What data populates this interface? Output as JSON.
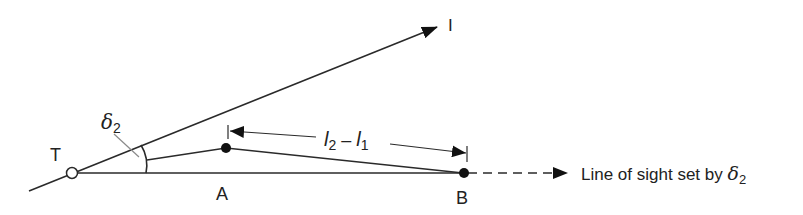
{
  "diagram": {
    "labels": {
      "T": "T",
      "A": "A",
      "B": "B",
      "I": "I",
      "delta_sym": "δ",
      "delta_sub": "2",
      "dim_l2": "l",
      "dim_l2_sub": "2",
      "dim_minus": " – ",
      "dim_l1": "l",
      "dim_l1_sub": "1",
      "line_of_sight_text": "Line of sight set by ",
      "line_of_sight_delta": "δ",
      "line_of_sight_sub": "2"
    },
    "colors": {
      "stroke": "#2a2a2a",
      "fill_point": "#111111",
      "open_point_fill": "#ffffff",
      "background": "#ffffff"
    }
  }
}
